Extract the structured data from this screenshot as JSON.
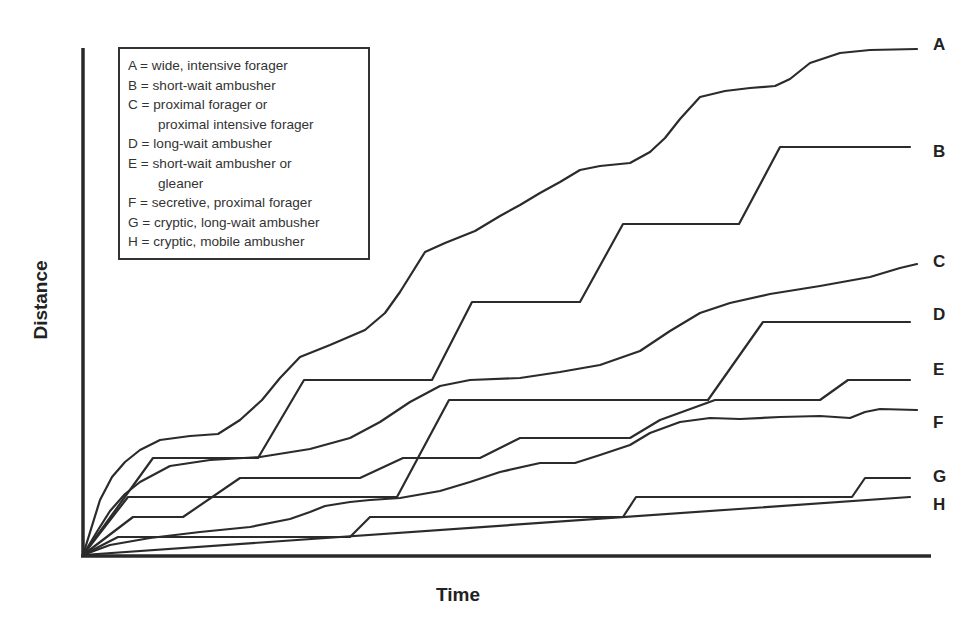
{
  "chart_data": {
    "type": "line",
    "title": "",
    "xlabel": "Time",
    "ylabel": "Distance",
    "grid": false,
    "legend_position": "upper-left (inset box)",
    "x_ticks": [],
    "y_ticks": [],
    "note": "Schematic cumulative distance vs. time; no numeric axes. Values are relative (0-100) read from plot geometry.",
    "legend": [
      {
        "key": "A",
        "text": "A = wide, intensive forager"
      },
      {
        "key": "B",
        "text": "B = short-wait ambusher"
      },
      {
        "key": "C",
        "text": "C = proximal forager or",
        "continuation": "proximal intensive forager"
      },
      {
        "key": "D",
        "text": "D = long-wait ambusher"
      },
      {
        "key": "E",
        "text": "E = short-wait ambusher or",
        "continuation": "gleaner"
      },
      {
        "key": "F",
        "text": "F = secretive, proximal forager"
      },
      {
        "key": "G",
        "text": "G = cryptic, long-wait ambusher"
      },
      {
        "key": "H",
        "text": "H = cryptic, mobile ambusher"
      }
    ],
    "series": [
      {
        "name": "A",
        "label": "wide, intensive forager",
        "final_relative": 100,
        "shape": "smooth, high, continually rising with plateaus",
        "points": [
          [
            83,
            555
          ],
          [
            100,
            500
          ],
          [
            112,
            477
          ],
          [
            125,
            462
          ],
          [
            140,
            450
          ],
          [
            160,
            440
          ],
          [
            190,
            436
          ],
          [
            218,
            434
          ],
          [
            240,
            420
          ],
          [
            262,
            400
          ],
          [
            280,
            378
          ],
          [
            300,
            357
          ],
          [
            330,
            345
          ],
          [
            365,
            330
          ],
          [
            385,
            313
          ],
          [
            400,
            292
          ],
          [
            425,
            252
          ],
          [
            445,
            243
          ],
          [
            475,
            231
          ],
          [
            500,
            216
          ],
          [
            520,
            205
          ],
          [
            540,
            193
          ],
          [
            560,
            182
          ],
          [
            580,
            170
          ],
          [
            600,
            166
          ],
          [
            630,
            163
          ],
          [
            650,
            152
          ],
          [
            665,
            138
          ],
          [
            680,
            119
          ],
          [
            700,
            97
          ],
          [
            725,
            91
          ],
          [
            750,
            88
          ],
          [
            775,
            86
          ],
          [
            790,
            79
          ],
          [
            810,
            63
          ],
          [
            840,
            53
          ],
          [
            870,
            50
          ],
          [
            917,
            49
          ]
        ]
      },
      {
        "name": "B",
        "label": "short-wait ambusher",
        "final_relative": 80,
        "shape": "staircase with 4 steps",
        "points": [
          [
            83,
            555
          ],
          [
            153,
            458
          ],
          [
            258,
            458
          ],
          [
            304,
            380
          ],
          [
            432,
            380
          ],
          [
            472,
            302
          ],
          [
            580,
            302
          ],
          [
            623,
            224
          ],
          [
            739,
            224
          ],
          [
            780,
            147
          ],
          [
            910,
            147
          ]
        ]
      },
      {
        "name": "C",
        "label": "proximal forager or proximal intensive forager",
        "final_relative": 58,
        "shape": "smooth sigmoid rises",
        "points": [
          [
            83,
            555
          ],
          [
            98,
            530
          ],
          [
            110,
            511
          ],
          [
            125,
            494
          ],
          [
            140,
            482
          ],
          [
            170,
            466
          ],
          [
            210,
            460
          ],
          [
            260,
            457
          ],
          [
            310,
            449
          ],
          [
            350,
            438
          ],
          [
            380,
            422
          ],
          [
            410,
            402
          ],
          [
            440,
            386
          ],
          [
            470,
            380
          ],
          [
            520,
            378
          ],
          [
            560,
            372
          ],
          [
            600,
            365
          ],
          [
            640,
            351
          ],
          [
            670,
            331
          ],
          [
            700,
            313
          ],
          [
            730,
            303
          ],
          [
            770,
            294
          ],
          [
            820,
            286
          ],
          [
            870,
            277
          ],
          [
            900,
            268
          ],
          [
            917,
            264
          ]
        ]
      },
      {
        "name": "D",
        "label": "long-wait ambusher",
        "final_relative": 46,
        "shape": "staircase with 3 steps",
        "points": [
          [
            83,
            555
          ],
          [
            128,
            497
          ],
          [
            397,
            497
          ],
          [
            449,
            400
          ],
          [
            708,
            400
          ],
          [
            763,
            322
          ],
          [
            910,
            322
          ]
        ]
      },
      {
        "name": "E",
        "label": "short-wait ambusher or gleaner",
        "final_relative": 35,
        "shape": "small frequent steps",
        "points": [
          [
            83,
            555
          ],
          [
            133,
            517
          ],
          [
            183,
            517
          ],
          [
            240,
            478
          ],
          [
            360,
            478
          ],
          [
            403,
            458
          ],
          [
            480,
            458
          ],
          [
            520,
            438
          ],
          [
            630,
            438
          ],
          [
            660,
            420
          ],
          [
            715,
            400
          ],
          [
            820,
            400
          ],
          [
            848,
            380
          ],
          [
            910,
            380
          ]
        ]
      },
      {
        "name": "F",
        "label": "secretive, proximal forager",
        "final_relative": 29,
        "shape": "smooth gradual rise",
        "points": [
          [
            83,
            555
          ],
          [
            110,
            545
          ],
          [
            150,
            538
          ],
          [
            200,
            532
          ],
          [
            250,
            527
          ],
          [
            290,
            519
          ],
          [
            310,
            512
          ],
          [
            325,
            506
          ],
          [
            350,
            502
          ],
          [
            370,
            500
          ],
          [
            400,
            498
          ],
          [
            440,
            491
          ],
          [
            470,
            482
          ],
          [
            500,
            472
          ],
          [
            540,
            463
          ],
          [
            575,
            463
          ],
          [
            600,
            455
          ],
          [
            630,
            445
          ],
          [
            650,
            433
          ],
          [
            680,
            422
          ],
          [
            710,
            418
          ],
          [
            740,
            419
          ],
          [
            780,
            417
          ],
          [
            820,
            416
          ],
          [
            850,
            418
          ],
          [
            865,
            412
          ],
          [
            880,
            409
          ],
          [
            917,
            410
          ]
        ]
      },
      {
        "name": "G",
        "label": "cryptic, long-wait ambusher",
        "final_relative": 15,
        "shape": "staircase with long waits",
        "points": [
          [
            83,
            555
          ],
          [
            118,
            537
          ],
          [
            350,
            537
          ],
          [
            370,
            517
          ],
          [
            623,
            517
          ],
          [
            636,
            497
          ],
          [
            852,
            497
          ],
          [
            865,
            478
          ],
          [
            910,
            478
          ]
        ]
      },
      {
        "name": "H",
        "label": "cryptic, mobile ambusher",
        "final_relative": 11,
        "shape": "straight, slow linear rise",
        "points": [
          [
            83,
            555
          ],
          [
            910,
            497
          ]
        ]
      }
    ],
    "axes": {
      "origin": [
        83,
        555
      ],
      "x_end": 930,
      "y_top": 48
    }
  },
  "labels": {
    "xlabel": "Time",
    "ylabel": "Distance",
    "end": {
      "A": "A",
      "B": "B",
      "C": "C",
      "D": "D",
      "E": "E",
      "F": "F",
      "G": "G",
      "H": "H"
    }
  },
  "legend": {
    "lines": [
      "A = wide, intensive forager",
      "B = short-wait ambusher",
      "C = proximal forager or",
      "proximal intensive forager",
      "D = long-wait ambusher",
      "E = short-wait ambusher or",
      "gleaner",
      "F = secretive, proximal forager",
      "G = cryptic, long-wait ambusher",
      "H = cryptic, mobile ambusher"
    ]
  }
}
